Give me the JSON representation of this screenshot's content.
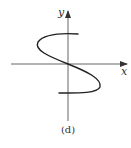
{
  "figure": {
    "caption": "(d)",
    "x_axis_label": "x",
    "y_axis_label": "y",
    "curve_description": "S-shaped curve passing through origin; not a function of x (fails vertical line test)",
    "colors": {
      "axis": "#555555",
      "curve": "#222222",
      "background": "#ffffff"
    }
  }
}
